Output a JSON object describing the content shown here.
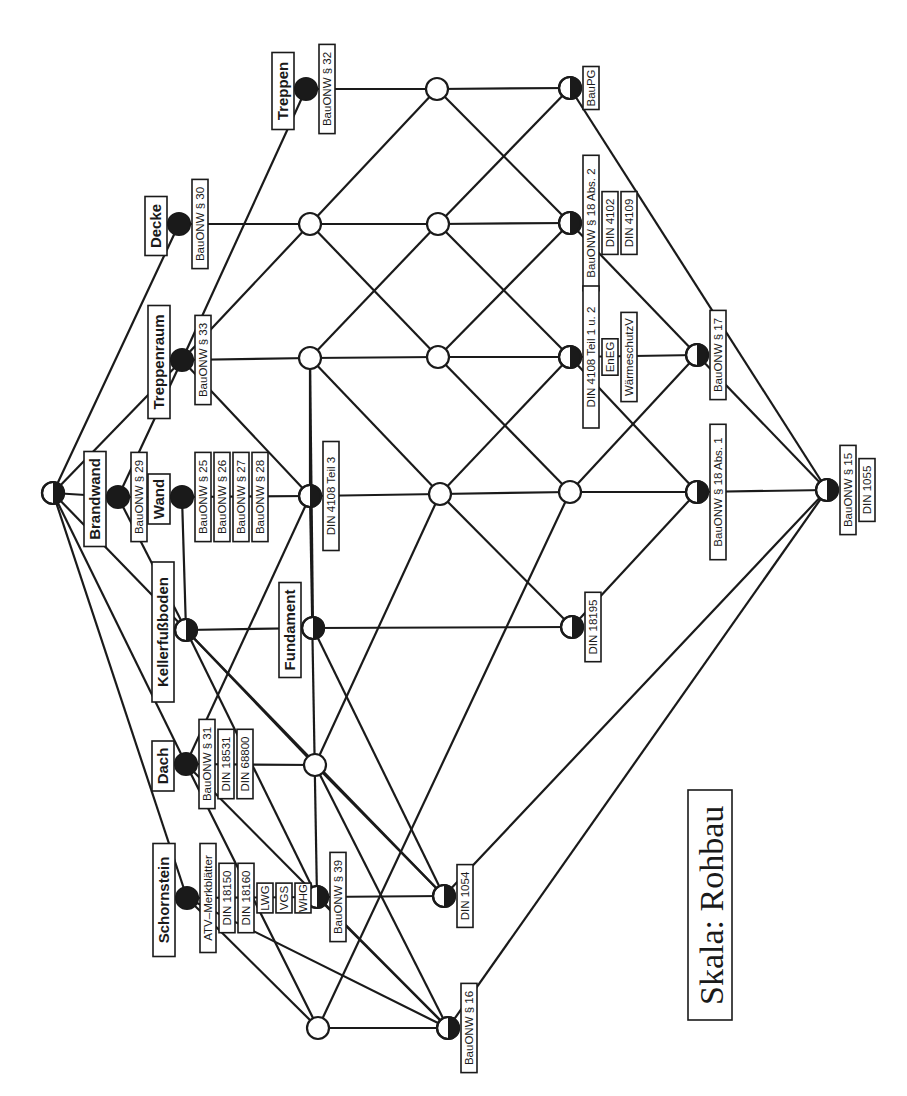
{
  "diagram": {
    "type": "concept-lattice",
    "title": "Skala: Rohbau",
    "orientation": "rotated-90-ccw",
    "colors": {
      "ink": "#1a1a1a",
      "paper": "#ffffff"
    },
    "nodes": [
      {
        "id": "top",
        "x": 53,
        "y": 493,
        "style": "half",
        "objects": [],
        "attributes": []
      },
      {
        "id": "brandwand",
        "x": 118,
        "y": 497,
        "style": "full",
        "objects": [
          "Brandwand"
        ],
        "attributes": [
          "BauONW  § 29"
        ]
      },
      {
        "id": "wand",
        "x": 182,
        "y": 497,
        "style": "full",
        "objects": [
          "Wand"
        ],
        "attributes": [
          "BauONW  § 25",
          "BauONW  § 26",
          "BauONW  § 27",
          "BauONW  § 28"
        ]
      },
      {
        "id": "treppenraum",
        "x": 182,
        "y": 360,
        "style": "full",
        "objects": [
          "Treppenraum"
        ],
        "attributes": [
          "BauONW  § 33"
        ]
      },
      {
        "id": "decke",
        "x": 179,
        "y": 224,
        "style": "full",
        "objects": [
          "Decke"
        ],
        "attributes": [
          "BauONW  § 30"
        ]
      },
      {
        "id": "treppen",
        "x": 306,
        "y": 89,
        "style": "full",
        "objects": [
          "Treppen"
        ],
        "attributes": [
          "BauONW  § 32"
        ]
      },
      {
        "id": "kellerfussboden",
        "x": 186,
        "y": 630,
        "style": "half",
        "objects": [
          "Kellerfußboden"
        ],
        "attributes": []
      },
      {
        "id": "dach",
        "x": 186,
        "y": 764,
        "style": "full",
        "objects": [
          "Dach"
        ],
        "attributes": [
          "BauONW  § 31",
          "DIN 18531",
          "DIN 68800"
        ]
      },
      {
        "id": "schornstein",
        "x": 187,
        "y": 898,
        "style": "full",
        "objects": [
          "Schornstein"
        ],
        "attributes": [
          "ATV–Merkblätter",
          "DIN 18150",
          "DIN 18160",
          "LWG",
          "VGS",
          "WHG"
        ]
      },
      {
        "id": "din4108t3",
        "x": 310,
        "y": 496,
        "style": "half",
        "objects": [],
        "attributes": [
          "DIN 4108 Teil 3"
        ]
      },
      {
        "id": "fundament",
        "x": 313,
        "y": 628,
        "style": "half",
        "objects": [
          "Fundament"
        ],
        "attributes": []
      },
      {
        "id": "o_310_224",
        "x": 310,
        "y": 224,
        "style": "open",
        "objects": [],
        "attributes": []
      },
      {
        "id": "o_310_358",
        "x": 310,
        "y": 358,
        "style": "open",
        "objects": [],
        "attributes": []
      },
      {
        "id": "o_437_89",
        "x": 437,
        "y": 89,
        "style": "open",
        "objects": [],
        "attributes": []
      },
      {
        "id": "o_438_224",
        "x": 438,
        "y": 224,
        "style": "open",
        "objects": [],
        "attributes": []
      },
      {
        "id": "o_438_357",
        "x": 438,
        "y": 357,
        "style": "open",
        "objects": [],
        "attributes": []
      },
      {
        "id": "o_440_494",
        "x": 440,
        "y": 494,
        "style": "open",
        "objects": [],
        "attributes": []
      },
      {
        "id": "o_570_492",
        "x": 570,
        "y": 492,
        "style": "open",
        "objects": [],
        "attributes": []
      },
      {
        "id": "o_315_765",
        "x": 315,
        "y": 765,
        "style": "open",
        "objects": [],
        "attributes": []
      },
      {
        "id": "o_318_1028",
        "x": 318,
        "y": 1028,
        "style": "open",
        "objects": [],
        "attributes": []
      },
      {
        "id": "bauonw39",
        "x": 317,
        "y": 897,
        "style": "half",
        "objects": [],
        "attributes": [
          "BauONW  § 39"
        ]
      },
      {
        "id": "din1054",
        "x": 444,
        "y": 896,
        "style": "half",
        "objects": [],
        "attributes": [
          "DIN 1054"
        ]
      },
      {
        "id": "bauonw16",
        "x": 448,
        "y": 1028,
        "style": "half",
        "objects": [],
        "attributes": [
          "BauONW  § 16"
        ]
      },
      {
        "id": "baupg",
        "x": 570,
        "y": 88,
        "style": "half",
        "objects": [],
        "attributes": [
          "BauPG"
        ]
      },
      {
        "id": "bauonw18abs2",
        "x": 570,
        "y": 223,
        "style": "half",
        "objects": [],
        "attributes": [
          "BauONW  § 18 Abs. 2",
          "DIN 4102",
          "DIN 4109"
        ]
      },
      {
        "id": "din4108t12",
        "x": 570,
        "y": 357,
        "style": "half",
        "objects": [],
        "attributes": [
          "DIN 4108 Teil 1 u. 2",
          "EnEG",
          "WärmeschutzV"
        ]
      },
      {
        "id": "din18195",
        "x": 572,
        "y": 627,
        "style": "half",
        "objects": [],
        "attributes": [
          "DIN 18195"
        ]
      },
      {
        "id": "bauonw17",
        "x": 697,
        "y": 355,
        "style": "half",
        "objects": [],
        "attributes": [
          "BauONW  § 17"
        ]
      },
      {
        "id": "bauonw18abs1",
        "x": 697,
        "y": 492,
        "style": "half",
        "objects": [],
        "attributes": [
          "BauONW  § 18 Abs. 1"
        ]
      },
      {
        "id": "bottom",
        "x": 827,
        "y": 490,
        "style": "half",
        "objects": [],
        "attributes": [
          "BauONW  § 15",
          "DIN 1055"
        ]
      }
    ],
    "edges": [
      [
        "top",
        "brandwand"
      ],
      [
        "top",
        "treppenraum"
      ],
      [
        "top",
        "decke"
      ],
      [
        "top",
        "kellerfussboden"
      ],
      [
        "top",
        "dach"
      ],
      [
        "top",
        "schornstein"
      ],
      [
        "brandwand",
        "wand"
      ],
      [
        "brandwand",
        "treppenraum"
      ],
      [
        "brandwand",
        "kellerfussboden"
      ],
      [
        "wand",
        "din4108t3"
      ],
      [
        "treppenraum",
        "treppen"
      ],
      [
        "treppenraum",
        "o_310_224"
      ],
      [
        "treppenraum",
        "o_310_358"
      ],
      [
        "treppenraum",
        "din4108t3"
      ],
      [
        "decke",
        "o_310_224"
      ],
      [
        "treppen",
        "o_437_89"
      ],
      [
        "kellerfussboden",
        "fundament"
      ],
      [
        "kellerfussboden",
        "wand"
      ],
      [
        "kellerfussboden",
        "o_315_765"
      ],
      [
        "kellerfussboden",
        "bauonw39"
      ],
      [
        "kellerfussboden",
        "din1054"
      ],
      [
        "dach",
        "o_315_765"
      ],
      [
        "dach",
        "din4108t3"
      ],
      [
        "dach",
        "bauonw16"
      ],
      [
        "dach",
        "o_318_1028"
      ],
      [
        "schornstein",
        "bauonw39"
      ],
      [
        "schornstein",
        "o_318_1028"
      ],
      [
        "schornstein",
        "bauonw16"
      ],
      [
        "din4108t3",
        "o_440_494"
      ],
      [
        "din4108t3",
        "o_310_358"
      ],
      [
        "din4108t3",
        "bauonw39"
      ],
      [
        "fundament",
        "din18195"
      ],
      [
        "fundament",
        "din1054"
      ],
      [
        "fundament",
        "o_310_358"
      ],
      [
        "o_310_224",
        "o_438_224"
      ],
      [
        "o_310_224",
        "o_437_89"
      ],
      [
        "o_310_224",
        "o_438_357"
      ],
      [
        "o_310_358",
        "o_438_357"
      ],
      [
        "o_310_358",
        "o_438_224"
      ],
      [
        "o_310_358",
        "o_440_494"
      ],
      [
        "o_437_89",
        "baupg"
      ],
      [
        "o_437_89",
        "bauonw18abs2"
      ],
      [
        "o_438_224",
        "bauonw18abs2"
      ],
      [
        "o_438_224",
        "baupg"
      ],
      [
        "o_438_224",
        "din4108t12"
      ],
      [
        "o_438_357",
        "din4108t12"
      ],
      [
        "o_438_357",
        "bauonw18abs2"
      ],
      [
        "o_438_357",
        "o_570_492"
      ],
      [
        "o_440_494",
        "o_570_492"
      ],
      [
        "o_440_494",
        "din4108t12"
      ],
      [
        "o_440_494",
        "din18195"
      ],
      [
        "o_440_494",
        "o_315_765"
      ],
      [
        "o_570_492",
        "bauonw18abs1"
      ],
      [
        "o_570_492",
        "bauonw17"
      ],
      [
        "o_570_492",
        "o_318_1028"
      ],
      [
        "o_315_765",
        "din1054"
      ],
      [
        "o_315_765",
        "bauonw16"
      ],
      [
        "bauonw39",
        "din1054"
      ],
      [
        "bauonw39",
        "bauonw16"
      ],
      [
        "o_318_1028",
        "bauonw16"
      ],
      [
        "din4108t12",
        "bauonw17"
      ],
      [
        "din4108t12",
        "bauonw18abs1"
      ],
      [
        "bauonw18abs2",
        "bauonw17"
      ],
      [
        "baupg",
        "bottom"
      ],
      [
        "din18195",
        "bauonw18abs1"
      ],
      [
        "din1054",
        "bottom"
      ],
      [
        "bauonw16",
        "bottom"
      ],
      [
        "bauonw17",
        "bottom"
      ],
      [
        "bauonw18abs1",
        "bottom"
      ]
    ]
  },
  "title_box": {
    "text": "Skala: Rohbau",
    "x": 707,
    "y": 960
  }
}
